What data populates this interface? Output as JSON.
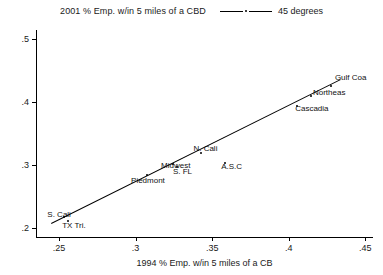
{
  "legend": {
    "series_label": "2001 % Emp. w/in 5 miles of a CBD",
    "line_label": "45 degrees"
  },
  "chart_data": {
    "type": "scatter",
    "title": "",
    "subtitle": "",
    "xlabel": "1994 % Emp. w/in 5 miles of a CB",
    "ylabel": "",
    "legend_position": "top",
    "grid": false,
    "xlim": [
      0.235,
      0.455
    ],
    "ylim": [
      0.185,
      0.515
    ],
    "xticks": [
      0.25,
      0.3,
      0.35,
      0.4,
      0.45
    ],
    "xticklabels": [
      ".25",
      ".3",
      ".35",
      ".4",
      ".45"
    ],
    "yticks": [
      0.2,
      0.3,
      0.4,
      0.5
    ],
    "yticklabels": [
      ".2",
      ".3",
      ".4",
      ".5"
    ],
    "series": [
      {
        "name": "2001 % Emp. w/in 5 miles of a CBD",
        "type": "scatter",
        "points": [
          {
            "label": "Gulf Coa",
            "x": 0.4275,
            "y": 0.4265,
            "label_dx": 4,
            "label_dy": -8
          },
          {
            "label": "Northeas",
            "x": 0.4145,
            "y": 0.41,
            "label_dx": 2,
            "label_dy": -3
          },
          {
            "label": "Cascadia",
            "x": 0.4055,
            "y": 0.394,
            "label_dx": -2,
            "label_dy": 3
          },
          {
            "label": "A.S.C",
            "x": 0.3585,
            "y": 0.303,
            "label_dx": -4,
            "label_dy": 4
          },
          {
            "label": "N. Cali",
            "x": 0.343,
            "y": 0.319,
            "label_dx": -8,
            "label_dy": -4
          },
          {
            "label": "Midwest",
            "x": 0.3245,
            "y": 0.301,
            "label_dx": -12,
            "label_dy": 2
          },
          {
            "label": "S. FL",
            "x": 0.327,
            "y": 0.2965,
            "label_dx": -4,
            "label_dy": 5
          },
          {
            "label": "Piedmont",
            "x": 0.3075,
            "y": 0.284,
            "label_dx": -16,
            "label_dy": 6
          },
          {
            "label": "S. Cali",
            "x": 0.2535,
            "y": 0.2175,
            "label_dx": -17,
            "label_dy": -2
          },
          {
            "label": "TX Tri.",
            "x": 0.256,
            "y": 0.21,
            "label_dx": -6,
            "label_dy": 5
          }
        ]
      },
      {
        "name": "45 degrees",
        "type": "line",
        "x": [
          0.245,
          0.434
        ],
        "y": [
          0.2075,
          0.437
        ]
      }
    ]
  },
  "colors": {
    "axis": "#000000",
    "marker": "#000000",
    "line": "#000000",
    "background": "#ffffff"
  }
}
